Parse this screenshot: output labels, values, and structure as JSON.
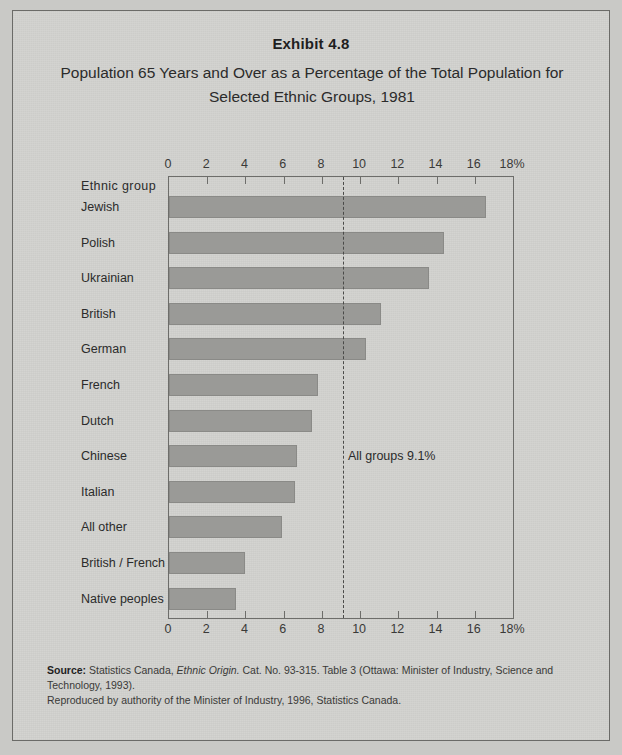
{
  "exhibit": {
    "number": "Exhibit 4.8",
    "title_line1": "Population 65 Years and Over as a Percentage of the Total Population for",
    "title_line2": "Selected Ethnic Groups, 1981"
  },
  "axis_title": "Ethnic  group",
  "source": {
    "label": "Source:",
    "text_part1": " Statistics Canada, ",
    "italic_title": "Ethnic Origin.",
    "text_part2": "  Cat. No. 93-315. Table 3 (Ottawa: Minister of Industry, Science and Technology, 1993).",
    "line2": "Reproduced by authority of the Minister of Industry, 1996, Statistics Canada."
  },
  "colors": {
    "bar_fill": "#9a9a97",
    "bar_border": "#8a8a87",
    "frame": "#6d6d6a",
    "paper": "#d3d3d0",
    "page_background": "#c9c9c6",
    "reference_line": "#4a4a48"
  },
  "chart_data": {
    "type": "bar",
    "orientation": "horizontal",
    "title": "Population 65 Years and Over as a Percentage of the Total Population for Selected Ethnic Groups, 1981",
    "xlabel": "",
    "ylabel": "Ethnic  group",
    "xlim": [
      0,
      18
    ],
    "x_tick_values": [
      0,
      2,
      4,
      6,
      8,
      10,
      12,
      14,
      16,
      18
    ],
    "x_tick_labels": [
      "0",
      "2",
      "4",
      "6",
      "8",
      "10",
      "12",
      "14",
      "16",
      "18%"
    ],
    "grid": false,
    "legend": false,
    "categories": [
      "Jewish",
      "Polish",
      "Ukrainian",
      "British",
      "German",
      "French",
      "Dutch",
      "Chinese",
      "Italian",
      "All other",
      "British / French",
      "Native peoples"
    ],
    "values": [
      16.6,
      14.4,
      13.6,
      11.1,
      10.3,
      7.8,
      7.5,
      6.7,
      6.6,
      5.9,
      4.0,
      3.5
    ],
    "annotations": [
      {
        "text": "All groups 9.1%",
        "value": 9.1,
        "style": "dashed-vertical-reference-line"
      }
    ]
  }
}
